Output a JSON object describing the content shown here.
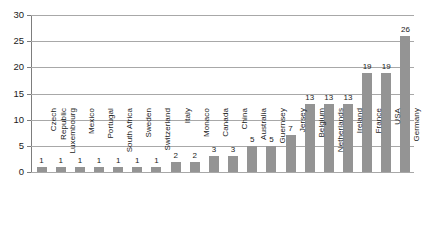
{
  "chart_data": {
    "type": "bar",
    "title": "",
    "subtitle": "",
    "xlabel": "",
    "ylabel": "",
    "ylim": [
      0,
      30
    ],
    "yticks": [
      0,
      5,
      10,
      15,
      20,
      25,
      30
    ],
    "grid": true,
    "legend": false,
    "legend_position": "none",
    "orientation": "vertical",
    "bar_color": "#949494",
    "gridline_color": "#a8a8a8",
    "axis_color": "#7d7d7d",
    "background_color": "#ffffff",
    "data_labels": true,
    "categories": [
      "Czech Republic",
      "Luxembourg",
      "Mexico",
      "Portugal",
      "South Africa",
      "Sweden",
      "Switzerland",
      "Italy",
      "Monaco",
      "Canada",
      "China",
      "Australia",
      "Guernsey",
      "Jersey",
      "Belgium",
      "Netherlands",
      "Ireland",
      "France",
      "USA",
      "Germany"
    ],
    "values": [
      1,
      1,
      1,
      1,
      1,
      1,
      1,
      2,
      2,
      3,
      3,
      5,
      5,
      7,
      13,
      13,
      13,
      19,
      19,
      26
    ]
  },
  "axis": {
    "y_tick_labels": [
      "30",
      "25",
      "20",
      "15",
      "10",
      "5",
      "0"
    ]
  }
}
